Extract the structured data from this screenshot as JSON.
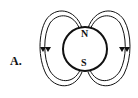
{
  "option_label": "A.",
  "magnet": {
    "north_label": "N",
    "south_label": "S"
  },
  "field_lines": {
    "arrow_direction": "down",
    "sides": [
      "left",
      "right"
    ],
    "lines_per_side": 2
  },
  "colors": {
    "stroke": "#111111",
    "background": "#ffffff"
  }
}
